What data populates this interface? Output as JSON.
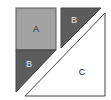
{
  "diagram": {
    "shapes": [
      {
        "id": "A",
        "label": "A",
        "kind": "square",
        "fill": "#a3a3a3"
      },
      {
        "id": "B-top",
        "label": "B",
        "kind": "right-triangle",
        "fill": "#5c5c5c"
      },
      {
        "id": "B-bottom",
        "label": "B",
        "kind": "right-triangle",
        "fill": "#5c5c5c"
      },
      {
        "id": "C",
        "label": "C",
        "kind": "right-triangle",
        "fill": "#ffffff"
      }
    ],
    "colors": {
      "outline": "#444444",
      "label_dark": "#222222",
      "label_light": "#e8e8e8"
    }
  }
}
